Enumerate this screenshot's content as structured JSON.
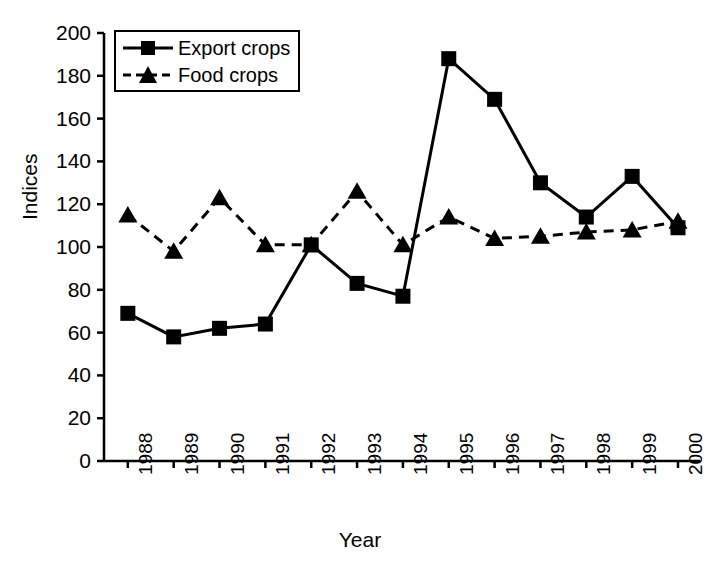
{
  "chart_data": {
    "type": "line",
    "title": "",
    "xlabel": "Year",
    "ylabel": "Indices",
    "categories": [
      "1988",
      "1989",
      "1990",
      "1991",
      "1992",
      "1993",
      "1994",
      "1995",
      "1996",
      "1997",
      "1998",
      "1999",
      "2000"
    ],
    "x": [
      1988,
      1989,
      1990,
      1991,
      1992,
      1993,
      1994,
      1995,
      1996,
      1997,
      1998,
      1999,
      2000
    ],
    "ylim": [
      0,
      200
    ],
    "yticks": [
      0,
      20,
      40,
      60,
      80,
      100,
      120,
      140,
      160,
      180,
      200
    ],
    "ytick_labels": [
      "0",
      "20",
      "40",
      "60",
      "80",
      "100",
      "120",
      "140",
      "160",
      "180",
      "200"
    ],
    "grid": false,
    "legend_position": "upper left",
    "series": [
      {
        "name": "Export crops",
        "marker": "square",
        "linestyle": "solid",
        "color": "#000000",
        "values": [
          69,
          58,
          62,
          64,
          101,
          83,
          77,
          188,
          169,
          130,
          114,
          133,
          109
        ]
      },
      {
        "name": "Food crops",
        "marker": "triangle",
        "linestyle": "dashed",
        "color": "#000000",
        "values": [
          115,
          98,
          123,
          101,
          101,
          126,
          101,
          114,
          104,
          105,
          107,
          108,
          112
        ]
      }
    ]
  },
  "legend": {
    "entries": [
      {
        "label": "Export crops"
      },
      {
        "label": "Food crops"
      }
    ]
  }
}
